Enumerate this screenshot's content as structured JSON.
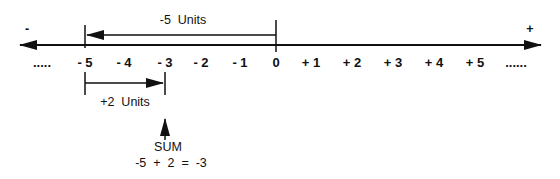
{
  "diagram": {
    "axis": {
      "negative_end_sign": "-",
      "positive_end_sign": "+",
      "left_ellipsis": ".....",
      "right_ellipsis": "......",
      "ticks": [
        {
          "label": "- 5",
          "x": 85
        },
        {
          "label": "- 4",
          "x": 124
        },
        {
          "label": "- 3",
          "x": 165
        },
        {
          "label": "- 2",
          "x": 201
        },
        {
          "label": "- 1",
          "x": 240
        },
        {
          "label": "0",
          "x": 276
        },
        {
          "label": "+ 1",
          "x": 311
        },
        {
          "label": "+ 2",
          "x": 352
        },
        {
          "label": "+ 3",
          "x": 393
        },
        {
          "label": "+ 4",
          "x": 434
        },
        {
          "label": "+ 5",
          "x": 475
        }
      ]
    },
    "step1": {
      "label": "-5  Units",
      "from": 0,
      "to": -5
    },
    "step2": {
      "label": "+2  Units",
      "from": -5,
      "to": -3
    },
    "result": {
      "label": "SUM",
      "equation": "-5  +  2  =  -3"
    },
    "colors": {
      "ink": "#111111",
      "background": "#ffffff"
    }
  }
}
